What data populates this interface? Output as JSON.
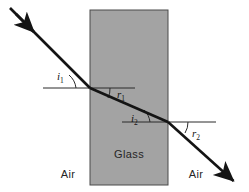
{
  "figure": {
    "type": "optics-ray-diagram",
    "title_text": "",
    "background_color": "#ffffff",
    "ray_color": "#141414",
    "slab_fill_color": "#a3a3a3",
    "slab_border_color": "#4a4a4a",
    "normal_line_color": "#2b2b2b",
    "text_color": "#262626"
  },
  "slab": {
    "label": "Glass",
    "x": 90,
    "y": 10,
    "width": 78,
    "height": 175,
    "label_x": 129,
    "label_y": 158
  },
  "media": {
    "left": {
      "label": "Air",
      "x": 68,
      "y": 178
    },
    "right": {
      "label": "Air",
      "x": 196,
      "y": 178
    }
  },
  "angles": [
    {
      "id": "i1",
      "symbol": "i",
      "subscript": "1",
      "name": "angle-of-incidence-first-surface",
      "label_x": 57,
      "label_y": 80,
      "arc": "M 76 88 A 20 20 0 0 0 69 75"
    },
    {
      "id": "r1",
      "symbol": "r",
      "subscript": "1",
      "name": "angle-of-refraction-first-surface",
      "label_x": 117,
      "label_y": 98,
      "arc": "M 110 88 A 20 20 0 0 1 108 98"
    },
    {
      "id": "i2",
      "symbol": "i",
      "subscript": "2",
      "name": "angle-of-incidence-second-surface",
      "label_x": 131,
      "label_y": 122,
      "arc": "M 150 122 A 20 20 0 0 0 144 110"
    },
    {
      "id": "r2",
      "symbol": "r",
      "subscript": "2",
      "name": "angle-of-refraction-second-surface",
      "label_x": 192,
      "label_y": 137,
      "arc": "M 188 122 A 20 20 0 0 1 185 133"
    }
  ],
  "rays": {
    "incident": {
      "name": "incident-ray",
      "x1": 10,
      "y1": 8,
      "x2": 90,
      "y2": 88,
      "arrow_at_x": 36,
      "arrow_at_y": 34
    },
    "refracted": {
      "name": "refracted-ray-inside-glass",
      "x1": 90,
      "y1": 88,
      "x2": 168,
      "y2": 122
    },
    "emergent": {
      "name": "emergent-ray",
      "x1": 168,
      "y1": 122,
      "x2": 238,
      "y2": 185
    }
  },
  "normals": [
    {
      "name": "reference-line-first-surface",
      "x1": 43,
      "y1": 88,
      "x2": 135,
      "y2": 88
    },
    {
      "name": "reference-line-second-surface",
      "x1": 122,
      "y1": 122,
      "x2": 216,
      "y2": 122
    }
  ]
}
